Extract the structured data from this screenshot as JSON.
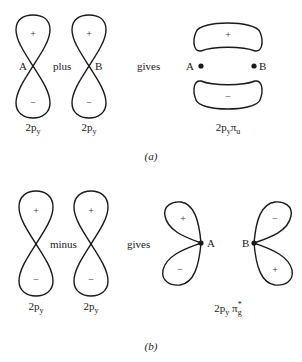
{
  "panel_a": {
    "atom_a_label": "A",
    "atom_b_label": "B",
    "operator": "plus",
    "result_word": "gives",
    "orbital1": {
      "base": "2p",
      "sub": "y",
      "top_sign": "+",
      "bottom_sign": "−"
    },
    "orbital2": {
      "base": "2p",
      "sub": "y",
      "top_sign": "+",
      "bottom_sign": "−"
    },
    "result": {
      "base": "2p",
      "sub": "y",
      "symbol": "π",
      "symbol_sub": "u",
      "top_sign": "+",
      "bottom_sign": "−",
      "left_atom": "A",
      "right_atom": "B"
    },
    "caption": "(a)"
  },
  "panel_b": {
    "operator": "minus",
    "result_word": "gives",
    "orbital1": {
      "base": "2p",
      "sub": "y",
      "top_sign": "+",
      "bottom_sign": "−"
    },
    "orbital2": {
      "base": "2p",
      "sub": "y",
      "top_sign": "+",
      "bottom_sign": "−"
    },
    "result": {
      "base": "2p",
      "sub": "y",
      "symbol": "π",
      "symbol_sub": "g",
      "symbol_sup": "*",
      "left_atom": "A",
      "right_atom": "B",
      "a_upper_sign": "+",
      "a_lower_sign": "−",
      "b_upper_sign": "−",
      "b_lower_sign": "+"
    },
    "caption": "(b)"
  },
  "colors": {
    "stroke": "#1a1a1a",
    "background": "#ffffff"
  }
}
